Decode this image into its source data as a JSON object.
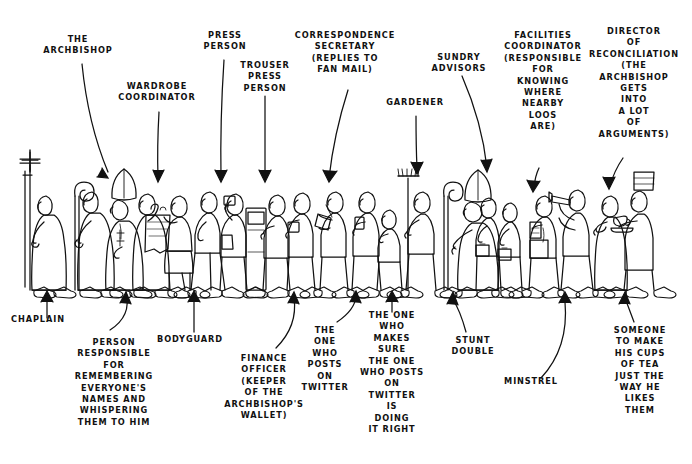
{
  "image": {
    "title": "The Archbishop's Entourage",
    "style": "pen-and-ink line cartoon, hand lettered capitals",
    "background_color": "#ffffff",
    "ink_color": "#111111",
    "width": 692,
    "height": 464
  },
  "labels_above": [
    {
      "id": "the-archbishop",
      "lines": [
        "THE",
        "ARCHBISHOP"
      ],
      "x": 78,
      "y": 42,
      "arrow_to_x": 96,
      "arrow_to_y": 180
    },
    {
      "id": "wardrobe-coordinator",
      "lines": [
        "WARDROBE",
        "COORDINATOR"
      ],
      "x": 157,
      "y": 89,
      "arrow_to_x": 157,
      "arrow_to_y": 188
    },
    {
      "id": "press-person",
      "lines": [
        "PRESS",
        "PERSON"
      ],
      "x": 225,
      "y": 38,
      "arrow_to_x": 220,
      "arrow_to_y": 190
    },
    {
      "id": "trouser-press-person",
      "lines": [
        "TROUSER",
        "PRESS",
        "PERSON"
      ],
      "x": 265,
      "y": 68,
      "arrow_to_x": 264,
      "arrow_to_y": 190
    },
    {
      "id": "correspondence-secretary",
      "lines": [
        "CORRESPONDENCE",
        "SECRETARY",
        "(REPLIES TO",
        "FAN MAIL)"
      ],
      "x": 345,
      "y": 38,
      "arrow_to_x": 330,
      "arrow_to_y": 190
    },
    {
      "id": "gardener",
      "lines": [
        "GARDENER"
      ],
      "x": 415,
      "y": 105,
      "arrow_to_x": 417,
      "arrow_to_y": 180
    },
    {
      "id": "sundry-advisors",
      "lines": [
        "SUNDRY",
        "ADVISORS"
      ],
      "x": 459,
      "y": 60,
      "arrow_to_x": 487,
      "arrow_to_y": 180
    },
    {
      "id": "facilities-coordinator",
      "lines": [
        "FACILITIES",
        "COORDINATOR",
        "(RESPONSIBLE",
        "FOR",
        "KNOWING",
        "WHERE",
        "NEARBY",
        "LOOS",
        "ARE)"
      ],
      "x": 543,
      "y": 38,
      "arrow_to_x": 533,
      "arrow_to_y": 190
    },
    {
      "id": "director-of-reconciliation",
      "lines": [
        "DIRECTOR",
        "OF",
        "RECONCILIATION",
        "(THE",
        "ARCHBISHOP",
        "GETS",
        "INTO",
        "A LOT",
        "OF",
        "ARGUMENTS)"
      ],
      "x": 634,
      "y": 34,
      "arrow_to_x": 608,
      "arrow_to_y": 190
    }
  ],
  "labels_below": [
    {
      "id": "chaplain",
      "lines": [
        "CHAPLAIN"
      ],
      "x": 38,
      "y": 322,
      "arrow_to_x": 47,
      "arrow_to_y": 292
    },
    {
      "id": "person-responsible-for-names",
      "lines": [
        "PERSON",
        "RESPONSIBLE",
        "FOR",
        "REMEMBERING",
        "EVERYONE'S",
        "NAMES AND",
        "WHISPERING",
        "THEM TO HIM"
      ],
      "x": 114,
      "y": 345,
      "arrow_to_x": 126,
      "arrow_to_y": 292
    },
    {
      "id": "bodyguard",
      "lines": [
        "BODYGUARD"
      ],
      "x": 190,
      "y": 342,
      "arrow_to_x": 194,
      "arrow_to_y": 292
    },
    {
      "id": "finance-officer",
      "lines": [
        "FINANCE",
        "OFFICER",
        "(KEEPER",
        "OF THE",
        "ARCHBISHOP'S",
        "WALLET)"
      ],
      "x": 264,
      "y": 361,
      "arrow_to_x": 294,
      "arrow_to_y": 292
    },
    {
      "id": "the-one-who-posts-on-twitter",
      "lines": [
        "THE",
        "ONE",
        "WHO",
        "POSTS",
        "ON",
        "TWITTER"
      ],
      "x": 325,
      "y": 333,
      "arrow_to_x": 356,
      "arrow_to_y": 292
    },
    {
      "id": "the-one-who-makes-sure",
      "lines": [
        "THE ONE",
        "WHO",
        "MAKES",
        "SURE",
        "THE ONE",
        "WHO POSTS",
        "ON",
        "TWITTER",
        "IS",
        "DOING",
        "IT RIGHT"
      ],
      "x": 392,
      "y": 318,
      "arrow_to_x": 392,
      "arrow_to_y": 292
    },
    {
      "id": "stunt-double",
      "lines": [
        "STUNT",
        "DOUBLE"
      ],
      "x": 473,
      "y": 343,
      "arrow_to_x": 453,
      "arrow_to_y": 292
    },
    {
      "id": "minstrel",
      "lines": [
        "MINSTREL"
      ],
      "x": 531,
      "y": 384,
      "arrow_to_x": 565,
      "arrow_to_y": 292
    },
    {
      "id": "someone-to-make-tea",
      "lines": [
        "SOMEONE",
        "TO MAKE",
        "HIS CUPS",
        "OF TEA",
        "JUST THE",
        "WAY HE",
        "LIKES",
        "THEM"
      ],
      "x": 640,
      "y": 333,
      "arrow_to_x": 625,
      "arrow_to_y": 292
    }
  ],
  "figures": [
    {
      "id": "chaplain",
      "description": "robed figure carrying tall processional cross"
    },
    {
      "id": "person-responsible-for-names",
      "description": "figure with crozier / shepherd's crook staff"
    },
    {
      "id": "the-archbishop",
      "description": "figure in mitre with pectoral cross"
    },
    {
      "id": "bodyguard",
      "description": "robed figure, hand raised to face"
    },
    {
      "id": "wardrobe-coordinator",
      "description": "figure carrying a hanging vestment"
    },
    {
      "id": "unlabelled-walker",
      "description": "figure walking, hands clasped"
    },
    {
      "id": "press-person",
      "description": "figure holding up a phone / camera"
    },
    {
      "id": "trouser-press-person",
      "description": "figure carrying a trouser press box"
    },
    {
      "id": "finance-officer",
      "description": "figure holding a purse / wallet"
    },
    {
      "id": "correspondence-secretary",
      "description": "figure writing on a letter pad"
    },
    {
      "id": "the-one-who-posts-on-twitter",
      "description": "figure looking at a phone"
    },
    {
      "id": "the-one-who-makes-sure",
      "description": "short figure peering at the phone"
    },
    {
      "id": "gardener",
      "description": "figure shouldering a garden rake"
    },
    {
      "id": "stunt-double",
      "description": "second mitred figure with crozier"
    },
    {
      "id": "sundry-advisors",
      "description": "two figures carrying briefcases"
    },
    {
      "id": "facilities-coordinator",
      "description": "figure with map and shoulder bag"
    },
    {
      "id": "minstrel",
      "description": "figure playing a horn / trumpet"
    },
    {
      "id": "director-of-reconciliation",
      "description": "robed figure with hands pressed together"
    },
    {
      "id": "someone-to-make-tea",
      "description": "figure in tall hat carrying a teacup and saucer"
    }
  ]
}
